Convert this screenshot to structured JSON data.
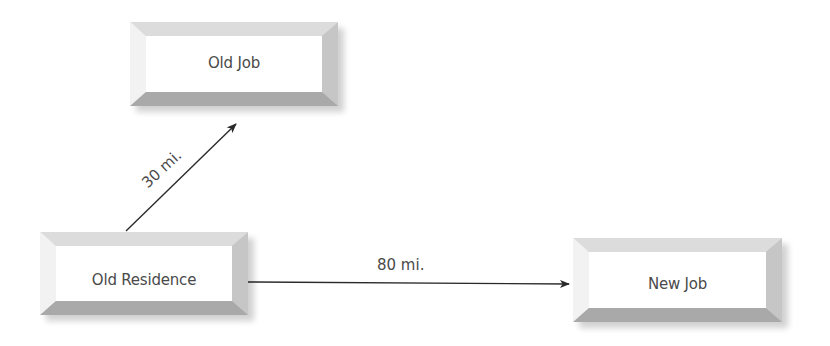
{
  "diagram": {
    "nodes": [
      {
        "id": "old-job",
        "label": "Old Job"
      },
      {
        "id": "old-residence",
        "label": "Old Residence"
      },
      {
        "id": "new-job",
        "label": "New Job"
      }
    ],
    "edges": [
      {
        "from": "old-residence",
        "to": "old-job",
        "label": "30 mi."
      },
      {
        "from": "old-residence",
        "to": "new-job",
        "label": "80 mi."
      }
    ],
    "colors": {
      "face": "#ffffff",
      "bevel_top": "#dcdcdc",
      "bevel_left": "#f2f2f2",
      "bevel_right": "#c6c6c6",
      "bevel_bottom": "#a9a9a9",
      "text": "#4a4a4a",
      "arrow": "#2a2a2a"
    }
  }
}
